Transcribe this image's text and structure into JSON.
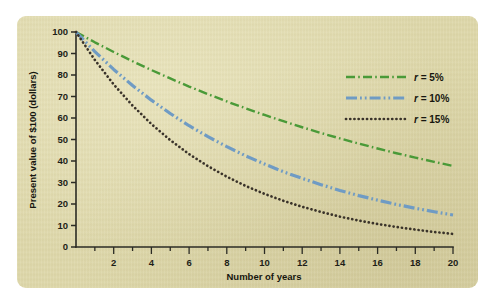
{
  "figure": {
    "panel_background": "#ded8ab",
    "page_background": "#ffffff"
  },
  "axes": {
    "x_title": "Number of years",
    "y_title": "Present value of $100 (dollars)",
    "x_tick_labels": [
      "2",
      "4",
      "6",
      "8",
      "10",
      "12",
      "14",
      "16",
      "18",
      "20"
    ],
    "y_tick_labels": [
      "0",
      "10",
      "20",
      "30",
      "40",
      "50",
      "60",
      "70",
      "80",
      "90",
      "100"
    ]
  },
  "legend": {
    "items": [
      {
        "label_var": "r",
        "label_rest": " = 5%",
        "label": "r = 5%",
        "color": "#4a9a38",
        "style": "dash-dot"
      },
      {
        "label_var": "r",
        "label_rest": " = 10%",
        "label": "r = 10%",
        "color": "#6f9bc4",
        "style": "dash-dot-dot"
      },
      {
        "label_var": "r",
        "label_rest": " = 15%",
        "label": "r = 15%",
        "color": "#3a332a",
        "style": "dotted"
      }
    ]
  },
  "chart_data": {
    "type": "line",
    "title": "",
    "xlabel": "Number of years",
    "ylabel": "Present value of $100 (dollars)",
    "xlim": [
      0,
      20
    ],
    "ylim": [
      0,
      100
    ],
    "xticks": [
      0,
      2,
      4,
      6,
      8,
      10,
      12,
      14,
      16,
      18,
      20
    ],
    "x_minor_tick_interval": 1,
    "yticks": [
      0,
      10,
      20,
      30,
      40,
      50,
      60,
      70,
      80,
      90,
      100
    ],
    "grid": false,
    "legend_position": "upper right inside",
    "x": [
      0,
      1,
      2,
      3,
      4,
      5,
      6,
      7,
      8,
      9,
      10,
      11,
      12,
      13,
      14,
      15,
      16,
      17,
      18,
      19,
      20
    ],
    "series": [
      {
        "name": "r = 5%",
        "color": "#4a9a38",
        "style": "dash-dot",
        "values": [
          100,
          95.2,
          90.7,
          86.4,
          82.3,
          78.4,
          74.6,
          71.1,
          67.7,
          64.5,
          61.4,
          58.5,
          55.7,
          53.0,
          50.5,
          48.1,
          45.8,
          43.6,
          41.6,
          39.6,
          37.7
        ]
      },
      {
        "name": "r = 10%",
        "color": "#6f9bc4",
        "style": "dash-dot-dot",
        "values": [
          100,
          90.9,
          82.6,
          75.1,
          68.3,
          62.1,
          56.4,
          51.3,
          46.7,
          42.4,
          38.6,
          35.0,
          31.9,
          29.0,
          26.3,
          23.9,
          21.8,
          19.8,
          18.0,
          16.4,
          14.9
        ]
      },
      {
        "name": "r = 15%",
        "color": "#3a332a",
        "style": "dotted",
        "values": [
          100,
          87.0,
          75.6,
          65.8,
          57.2,
          49.7,
          43.2,
          37.6,
          32.7,
          28.4,
          24.7,
          21.5,
          18.7,
          16.3,
          14.1,
          12.3,
          10.7,
          9.3,
          8.1,
          7.0,
          6.1
        ]
      }
    ]
  }
}
